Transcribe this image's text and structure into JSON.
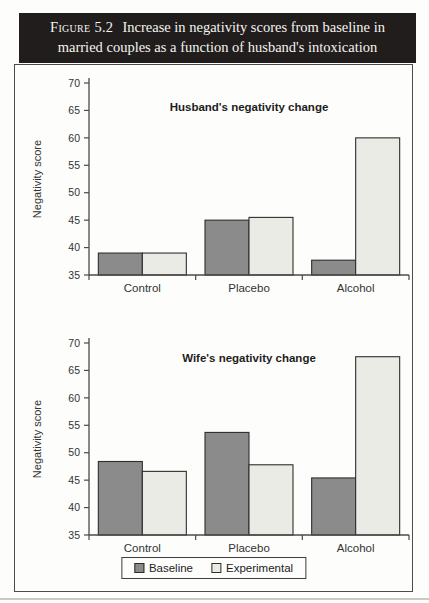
{
  "figure": {
    "label": "Figure 5.2",
    "title": "Increase in negativity scores from baseline in married couples as a function of husband's intoxication"
  },
  "colors": {
    "header_bg": "#201d1c",
    "header_text": "#f6f4ef",
    "series_fills": [
      "#8b8b8b",
      "#ebebe5"
    ],
    "bar_stroke": "#2e2e2e",
    "axis": "#4a4a4a",
    "text": "#333333",
    "box_border": "#4d4d4d",
    "page_bg": "#fdfdfc"
  },
  "legend": {
    "items": [
      {
        "label": "Baseline"
      },
      {
        "label": "Experimental"
      }
    ],
    "position": "bottom-center-shared"
  },
  "chart_data": [
    {
      "type": "bar",
      "title": "Husband's negativity change",
      "categories": [
        "Control",
        "Placebo",
        "Alcohol"
      ],
      "series": [
        {
          "name": "Baseline",
          "values": [
            39,
            45,
            37.7
          ]
        },
        {
          "name": "Experimental",
          "values": [
            39,
            45.5,
            60
          ]
        }
      ],
      "xlabel": "",
      "ylabel": "Negativity score",
      "ylim": [
        35,
        70
      ],
      "yticks": [
        35,
        40,
        45,
        50,
        55,
        60,
        65,
        70
      ],
      "grid": false,
      "title_y": 46
    },
    {
      "type": "bar",
      "title": "Wife's negativity change",
      "categories": [
        "Control",
        "Placebo",
        "Alcohol"
      ],
      "series": [
        {
          "name": "Baseline",
          "values": [
            48.4,
            53.7,
            45.4
          ]
        },
        {
          "name": "Experimental",
          "values": [
            46.6,
            47.8,
            67.5
          ]
        }
      ],
      "xlabel": "",
      "ylabel": "Negativity score",
      "ylim": [
        35,
        70
      ],
      "yticks": [
        35,
        40,
        45,
        50,
        55,
        60,
        65,
        70
      ],
      "grid": false,
      "title_y": 37
    }
  ]
}
